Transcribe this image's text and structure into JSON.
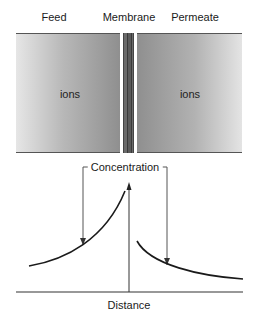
{
  "header": {
    "feed": "Feed",
    "membrane": "Membrane",
    "permeate": "Permeate"
  },
  "panels": {
    "feed_ions": "ions",
    "permeate_ions": "ions"
  },
  "graph": {
    "y_label": "Concentration",
    "x_label": "Distance"
  },
  "colors": {
    "line": "#1a1a1a",
    "arrow": "#555555",
    "panel_dark": "#8f8f8f",
    "panel_light": "#e6e6e6",
    "membrane": "#6a6a6a"
  }
}
